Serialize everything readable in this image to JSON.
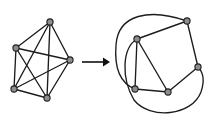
{
  "figure": {
    "width": 210,
    "height": 124,
    "background_color": "#ffffff"
  },
  "style": {
    "edge_color": "#1c1c1c",
    "edge_width": 1.35,
    "vertex_fill": "#8d8d8d",
    "vertex_stroke": "#1f1f1f",
    "vertex_radius": 3.1,
    "arrow_color": "#101010"
  },
  "left_graph": {
    "name": "non-planar-drawing",
    "caption": "",
    "vertices": [
      {
        "id": "a",
        "label": "",
        "x": 50,
        "y": 22
      },
      {
        "id": "b",
        "label": "",
        "x": 16,
        "y": 48
      },
      {
        "id": "c",
        "label": "",
        "x": 70,
        "y": 60
      },
      {
        "id": "d",
        "label": "",
        "x": 14,
        "y": 89
      },
      {
        "id": "e",
        "label": "",
        "x": 47,
        "y": 98
      }
    ],
    "edges": [
      {
        "from": "a",
        "to": "b"
      },
      {
        "from": "a",
        "to": "c"
      },
      {
        "from": "a",
        "to": "d"
      },
      {
        "from": "a",
        "to": "e"
      },
      {
        "from": "b",
        "to": "c"
      },
      {
        "from": "b",
        "to": "d"
      },
      {
        "from": "b",
        "to": "e"
      },
      {
        "from": "c",
        "to": "d"
      },
      {
        "from": "c",
        "to": "e"
      },
      {
        "from": "d",
        "to": "e"
      }
    ],
    "edge_crossings": 4
  },
  "arrow": {
    "name": "transform-arrow",
    "label": "",
    "x1": 82,
    "y1": 62,
    "x2": 110,
    "y2": 62,
    "direction": "right"
  },
  "right_graph": {
    "name": "planar-drawing",
    "caption": "",
    "vertices": [
      {
        "id": "a",
        "label": "",
        "x": 187,
        "y": 21
      },
      {
        "id": "b",
        "label": "",
        "x": 137,
        "y": 39
      },
      {
        "id": "c",
        "label": "",
        "x": 198,
        "y": 67
      },
      {
        "id": "d",
        "label": "",
        "x": 135,
        "y": 89
      },
      {
        "id": "e",
        "label": "",
        "x": 168,
        "y": 92
      }
    ],
    "straight_edges": [
      {
        "from": "a",
        "to": "b"
      },
      {
        "from": "a",
        "to": "c"
      },
      {
        "from": "b",
        "to": "d"
      },
      {
        "from": "b",
        "to": "e"
      },
      {
        "from": "c",
        "to": "e"
      },
      {
        "from": "d",
        "to": "e"
      }
    ],
    "curved_edges": [
      {
        "from": "a",
        "to": "d",
        "path": "M187,21 C150,8 118,14 116,45 C114,70 122,84 135,89",
        "note": "outer arc over the left side"
      },
      {
        "from": "b",
        "to": "c",
        "path": "M137,39 C122,48 121,78 134,100 C150,120 192,116 201,92 C205,80 203,72 198,67",
        "note": "outer arc under the bottom"
      }
    ],
    "edge_crossings": 0
  }
}
